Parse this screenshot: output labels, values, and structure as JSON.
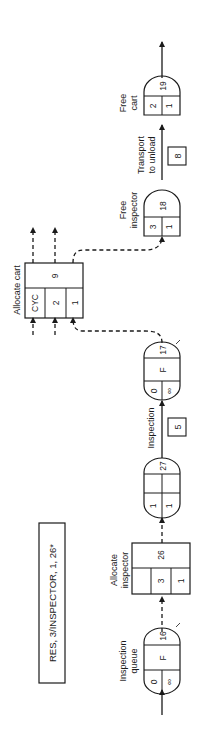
{
  "statement": "RES, 3/INSPECTOR, 1, 26*",
  "nodes": {
    "inspection_queue": {
      "label1": "Inspection",
      "label2": "queue",
      "top_left": "0",
      "top_mid": "F",
      "number": "16",
      "bottom_left": "∞"
    },
    "allocate_inspector": {
      "label1": "Allocate",
      "label2": "inspector",
      "cell_a": "",
      "cell_b": "3",
      "cell_c": "1",
      "number": "26"
    },
    "node_27": {
      "left_top": "1",
      "left_bottom": "1",
      "number": "27"
    },
    "inspection_activity": {
      "label": "Inspection",
      "duration": "5"
    },
    "inspection_wait": {
      "top_left": "0",
      "top_mid": "F",
      "number": "17",
      "bottom_left": "∞"
    },
    "allocate_cart": {
      "label": "Allocate cart",
      "cell_a": "CYC",
      "cell_b": "2",
      "cell_c": "1",
      "number": "9"
    },
    "free_inspector": {
      "label1": "Free",
      "label2": "inspector",
      "left": "3",
      "right": "1",
      "number": "18"
    },
    "transport_activity": {
      "label1": "Transport",
      "label2": "to unload",
      "duration": "8"
    },
    "free_cart": {
      "label1": "Free",
      "label2": "cart",
      "left": "2",
      "right": "1",
      "number": "19"
    }
  }
}
